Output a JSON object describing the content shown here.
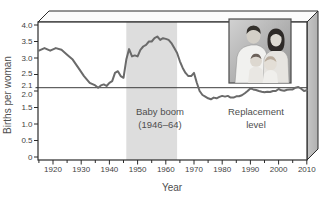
{
  "figure": {
    "kind": "textbook-fertility-chart"
  },
  "chart_data": {
    "type": "line",
    "title": "",
    "xlabel": "Year",
    "ylabel": "Births per woman",
    "xlim": [
      1915,
      2010
    ],
    "ylim": [
      0,
      4.2
    ],
    "grid": false,
    "legend": "none",
    "line_color": "#6a6a6a",
    "box_face_color": "#bdbdbd",
    "band": {
      "start": 1946,
      "end": 1964,
      "color": "#dddddd",
      "label_line1": "Baby boom",
      "label_line2": "(1946–64)"
    },
    "reference_line": {
      "value": 2.1,
      "color": "#3d3d3d",
      "label_line1": "Replacement",
      "label_line2": "level"
    },
    "x_ticks_major": [
      1920,
      1930,
      1940,
      1950,
      1960,
      1970,
      1980,
      1990,
      2000,
      2010
    ],
    "x_ticks_minor": [
      1915,
      1925,
      1935,
      1945,
      1955,
      1965,
      1975,
      1985,
      1995,
      2005
    ],
    "y_ticks": [
      {
        "label": "4.0",
        "value": 4.0,
        "dy": 0
      },
      {
        "label": "3.5",
        "value": 3.5,
        "dy": 0
      },
      {
        "label": "3.0",
        "value": 3.0,
        "dy": 0
      },
      {
        "label": "2.5",
        "value": 2.5,
        "dy": -1
      },
      {
        "label": "2.1",
        "value": 2.1,
        "dy": -3
      },
      {
        "label": "2.0",
        "value": 2.0,
        "dy": 3
      },
      {
        "label": "1.5",
        "value": 1.5,
        "dy": 0
      },
      {
        "label": "1.0",
        "value": 1.0,
        "dy": 0
      },
      {
        "label": "0.5",
        "value": 0.5,
        "dy": 0
      },
      {
        "label": "0",
        "value": 0.0,
        "dy": 0
      }
    ],
    "series": [
      {
        "name": "births-per-woman",
        "points": [
          [
            1915,
            3.22
          ],
          [
            1917,
            3.3
          ],
          [
            1919,
            3.22
          ],
          [
            1921,
            3.3
          ],
          [
            1923,
            3.25
          ],
          [
            1925,
            3.1
          ],
          [
            1927,
            2.95
          ],
          [
            1929,
            2.7
          ],
          [
            1931,
            2.45
          ],
          [
            1933,
            2.25
          ],
          [
            1935,
            2.17
          ],
          [
            1936,
            2.1
          ],
          [
            1937,
            2.17
          ],
          [
            1938,
            2.2
          ],
          [
            1939,
            2.15
          ],
          [
            1940,
            2.25
          ],
          [
            1941,
            2.3
          ],
          [
            1942,
            2.55
          ],
          [
            1943,
            2.6
          ],
          [
            1944,
            2.45
          ],
          [
            1945,
            2.4
          ],
          [
            1946,
            2.95
          ],
          [
            1947,
            3.27
          ],
          [
            1948,
            3.05
          ],
          [
            1949,
            3.08
          ],
          [
            1950,
            3.05
          ],
          [
            1951,
            3.25
          ],
          [
            1952,
            3.35
          ],
          [
            1953,
            3.4
          ],
          [
            1954,
            3.5
          ],
          [
            1955,
            3.5
          ],
          [
            1956,
            3.6
          ],
          [
            1957,
            3.65
          ],
          [
            1958,
            3.55
          ],
          [
            1959,
            3.6
          ],
          [
            1960,
            3.58
          ],
          [
            1961,
            3.55
          ],
          [
            1962,
            3.45
          ],
          [
            1963,
            3.3
          ],
          [
            1964,
            3.15
          ],
          [
            1965,
            2.9
          ],
          [
            1966,
            2.7
          ],
          [
            1967,
            2.55
          ],
          [
            1968,
            2.45
          ],
          [
            1969,
            2.45
          ],
          [
            1970,
            2.55
          ],
          [
            1971,
            2.25
          ],
          [
            1972,
            2.0
          ],
          [
            1973,
            1.88
          ],
          [
            1974,
            1.83
          ],
          [
            1975,
            1.78
          ],
          [
            1976,
            1.75
          ],
          [
            1977,
            1.8
          ],
          [
            1978,
            1.78
          ],
          [
            1979,
            1.82
          ],
          [
            1980,
            1.85
          ],
          [
            1981,
            1.83
          ],
          [
            1982,
            1.85
          ],
          [
            1983,
            1.8
          ],
          [
            1984,
            1.8
          ],
          [
            1985,
            1.84
          ],
          [
            1986,
            1.84
          ],
          [
            1987,
            1.87
          ],
          [
            1988,
            1.93
          ],
          [
            1989,
            2.0
          ],
          [
            1990,
            2.08
          ],
          [
            1991,
            2.05
          ],
          [
            1992,
            2.03
          ],
          [
            1993,
            2.0
          ],
          [
            1994,
            1.98
          ],
          [
            1995,
            1.96
          ],
          [
            1996,
            1.98
          ],
          [
            1997,
            1.97
          ],
          [
            1998,
            2.0
          ],
          [
            1999,
            2.0
          ],
          [
            2000,
            2.06
          ],
          [
            2001,
            2.02
          ],
          [
            2002,
            2.01
          ],
          [
            2003,
            2.04
          ],
          [
            2004,
            2.05
          ],
          [
            2005,
            2.05
          ],
          [
            2006,
            2.1
          ],
          [
            2007,
            2.12
          ],
          [
            2008,
            2.07
          ],
          [
            2009,
            2.0
          ],
          [
            2010,
            2.02
          ]
        ]
      }
    ]
  },
  "photo": {
    "name": "family-portrait",
    "frame_color": "#4a4a4a"
  }
}
